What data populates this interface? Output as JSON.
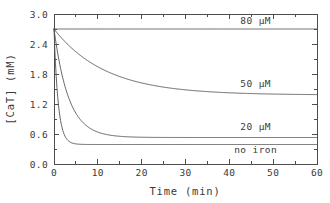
{
  "chart_data": {
    "type": "line",
    "title": "",
    "xlabel": "Time (min)",
    "ylabel": "[CaT] (mM)",
    "xlim": [
      0,
      60
    ],
    "ylim": [
      0.0,
      3.0
    ],
    "xticks": [
      0,
      10,
      20,
      30,
      40,
      50,
      60
    ],
    "xtick_labels": [
      "0",
      "10",
      "20",
      "30",
      "40",
      "50",
      "60"
    ],
    "xminor_step": 5,
    "yticks": [
      0.0,
      0.6,
      1.2,
      1.8,
      2.4,
      3.0
    ],
    "ytick_labels": [
      "0.0",
      "0.6",
      "1.2",
      "1.8",
      "2.4",
      "3.0"
    ],
    "yminor_step": 0.3,
    "grid": false,
    "legend_position": "inline-right",
    "series": [
      {
        "name": "80 μM",
        "label": "80 μM",
        "label_x": 46,
        "label_y": 2.88,
        "y0": 2.7,
        "yinf": 2.7,
        "rate": 0.3,
        "x": [
          0,
          2,
          5,
          10,
          15,
          20,
          25,
          30,
          35,
          40,
          45,
          50,
          55,
          60
        ],
        "values": [
          2.7,
          2.7,
          2.7,
          2.7,
          2.7,
          2.7,
          2.7,
          2.7,
          2.7,
          2.7,
          2.7,
          2.7,
          2.7,
          2.7
        ]
      },
      {
        "name": "50 μM",
        "label": "50 μM",
        "label_x": 46,
        "label_y": 1.62,
        "y0": 2.7,
        "yinf": 1.38,
        "rate": 0.085,
        "x": [
          0,
          2,
          5,
          10,
          15,
          20,
          25,
          30,
          35,
          40,
          45,
          50,
          55,
          60
        ],
        "values": [
          2.7,
          2.59,
          2.44,
          2.24,
          2.07,
          1.94,
          1.84,
          1.76,
          1.69,
          1.62,
          1.56,
          1.51,
          1.46,
          1.41
        ]
      },
      {
        "name": "20 μM",
        "label": "20 μM",
        "label_x": 46,
        "label_y": 0.75,
        "y0": 2.7,
        "yinf": 0.53,
        "rate": 0.3,
        "x": [
          0,
          2,
          5,
          10,
          15,
          20,
          25,
          30,
          35,
          40,
          45,
          50,
          55,
          60
        ],
        "values": [
          2.7,
          1.72,
          1.02,
          0.64,
          0.56,
          0.545,
          0.54,
          0.535,
          0.53,
          0.53,
          0.525,
          0.525,
          0.52,
          0.52
        ]
      },
      {
        "name": "no iron",
        "label": "no iron",
        "label_x": 46,
        "label_y": 0.3,
        "y0": 2.7,
        "yinf": 0.39,
        "rate": 1.05,
        "x": [
          0,
          1,
          2,
          3,
          5,
          8,
          10,
          15,
          20,
          30,
          40,
          50,
          60
        ],
        "values": [
          2.7,
          1.2,
          0.67,
          0.49,
          0.4,
          0.39,
          0.39,
          0.39,
          0.39,
          0.39,
          0.39,
          0.39,
          0.39
        ]
      }
    ]
  },
  "figure": {
    "plot_left": 54,
    "plot_right": 317,
    "plot_top": 14,
    "plot_bottom": 164
  }
}
